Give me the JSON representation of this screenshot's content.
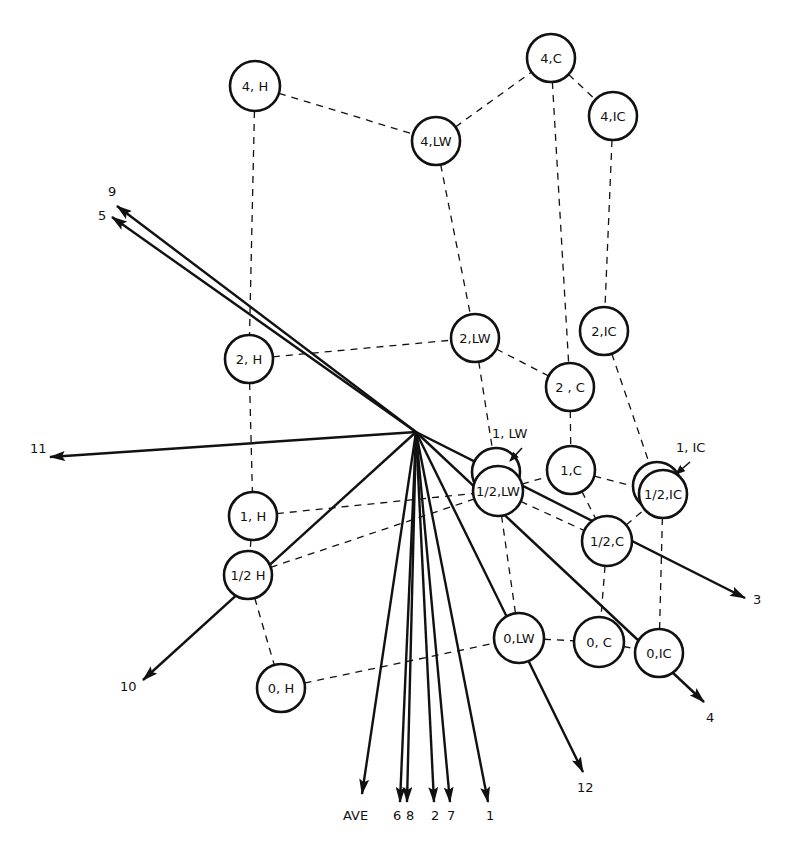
{
  "diagram": {
    "origin": {
      "x": 416,
      "y": 432
    },
    "nodes": [
      {
        "id": "4H",
        "label": "4, H",
        "x": 255,
        "y": 86,
        "r": 25
      },
      {
        "id": "4LW",
        "label": "4,LW",
        "x": 436,
        "y": 141,
        "r": 24
      },
      {
        "id": "4C",
        "label": "4,C",
        "x": 551,
        "y": 58,
        "r": 24
      },
      {
        "id": "4IC",
        "label": "4,IC",
        "x": 613,
        "y": 116,
        "r": 24
      },
      {
        "id": "2H",
        "label": "2, H",
        "x": 249,
        "y": 359,
        "r": 24
      },
      {
        "id": "2LW",
        "label": "2,LW",
        "x": 475,
        "y": 338,
        "r": 24
      },
      {
        "id": "2IC",
        "label": "2,IC",
        "x": 604,
        "y": 331,
        "r": 24
      },
      {
        "id": "2C",
        "label": "2 , C",
        "x": 570,
        "y": 387,
        "r": 24
      },
      {
        "id": "1LW",
        "label": "",
        "x": 496,
        "y": 472,
        "r": 24
      },
      {
        "id": "1C",
        "label": "1,C",
        "x": 571,
        "y": 470,
        "r": 24
      },
      {
        "id": "1IC",
        "label": "",
        "x": 657,
        "y": 486,
        "r": 24
      },
      {
        "id": "1H",
        "label": "1, H",
        "x": 253,
        "y": 516,
        "r": 24
      },
      {
        "id": "halfLW",
        "label": "1/2,LW",
        "x": 498,
        "y": 491,
        "r": 25
      },
      {
        "id": "halfIC",
        "label": "1/2,IC",
        "x": 663,
        "y": 494,
        "r": 24
      },
      {
        "id": "halfC",
        "label": "1/2,C",
        "x": 607,
        "y": 541,
        "r": 25
      },
      {
        "id": "halfH",
        "label": "1/2 H",
        "x": 248,
        "y": 575,
        "r": 24
      },
      {
        "id": "0LW",
        "label": "0,LW",
        "x": 519,
        "y": 638,
        "r": 25
      },
      {
        "id": "0C",
        "label": "0, C",
        "x": 599,
        "y": 642,
        "r": 25
      },
      {
        "id": "0IC",
        "label": "0,IC",
        "x": 659,
        "y": 653,
        "r": 24
      },
      {
        "id": "0H",
        "label": "0, H",
        "x": 281,
        "y": 688,
        "r": 24
      }
    ],
    "edges": [
      [
        "4H",
        "4LW"
      ],
      [
        "4LW",
        "4C"
      ],
      [
        "4C",
        "4IC"
      ],
      [
        "4H",
        "2H"
      ],
      [
        "4LW",
        "2LW"
      ],
      [
        "4C",
        "2C"
      ],
      [
        "4IC",
        "2IC"
      ],
      [
        "2H",
        "2LW"
      ],
      [
        "2LW",
        "2C"
      ],
      [
        "2H",
        "1H"
      ],
      [
        "2LW",
        "1LW"
      ],
      [
        "2C",
        "1C"
      ],
      [
        "2IC",
        "1IC"
      ],
      [
        "1H",
        "halfLW"
      ],
      [
        "halfLW",
        "1C"
      ],
      [
        "1C",
        "halfIC"
      ],
      [
        "1H",
        "halfH"
      ],
      [
        "halfH",
        "halfLW"
      ],
      [
        "halfLW",
        "halfC"
      ],
      [
        "1C",
        "halfC"
      ],
      [
        "halfC",
        "halfIC"
      ],
      [
        "halfH",
        "0H"
      ],
      [
        "halfLW",
        "0LW"
      ],
      [
        "halfC",
        "0C"
      ],
      [
        "halfIC",
        "0IC"
      ],
      [
        "0H",
        "0LW"
      ],
      [
        "0LW",
        "0C"
      ],
      [
        "0C",
        "0IC"
      ]
    ],
    "callouts": [
      {
        "label": "1, LW",
        "text_x": 492,
        "text_y": 438,
        "from_x": 522,
        "from_y": 448,
        "to_x": 510,
        "to_y": 461
      },
      {
        "label": "1, IC",
        "text_x": 676,
        "text_y": 452,
        "from_x": 690,
        "from_y": 462,
        "to_x": 676,
        "to_y": 474
      }
    ],
    "vectors": [
      {
        "label": "9",
        "tip_x": 117,
        "tip_y": 206,
        "label_x": 108,
        "label_y": 196
      },
      {
        "label": "5",
        "tip_x": 112,
        "tip_y": 217,
        "label_x": 98,
        "label_y": 220
      },
      {
        "label": "11",
        "tip_x": 50,
        "tip_y": 457,
        "label_x": 30,
        "label_y": 453
      },
      {
        "label": "10",
        "tip_x": 143,
        "tip_y": 680,
        "label_x": 120,
        "label_y": 691
      },
      {
        "label": "AVE",
        "tip_x": 362,
        "tip_y": 794,
        "label_x": 343,
        "label_y": 820
      },
      {
        "label": "6",
        "tip_x": 400,
        "tip_y": 802,
        "label_x": 393,
        "label_y": 820
      },
      {
        "label": "8",
        "tip_x": 407,
        "tip_y": 802,
        "label_x": 406,
        "label_y": 820
      },
      {
        "label": "2",
        "tip_x": 434,
        "tip_y": 802,
        "label_x": 431,
        "label_y": 820
      },
      {
        "label": "7",
        "tip_x": 450,
        "tip_y": 802,
        "label_x": 447,
        "label_y": 820
      },
      {
        "label": "1",
        "tip_x": 488,
        "tip_y": 802,
        "label_x": 486,
        "label_y": 820
      },
      {
        "label": "12",
        "tip_x": 583,
        "tip_y": 772,
        "label_x": 577,
        "label_y": 792
      },
      {
        "label": "4",
        "tip_x": 704,
        "tip_y": 702,
        "label_x": 706,
        "label_y": 722
      },
      {
        "label": "3",
        "tip_x": 745,
        "tip_y": 598,
        "label_x": 753,
        "label_y": 604
      }
    ],
    "colors": {
      "ink": "#111111",
      "background": "#ffffff"
    }
  }
}
